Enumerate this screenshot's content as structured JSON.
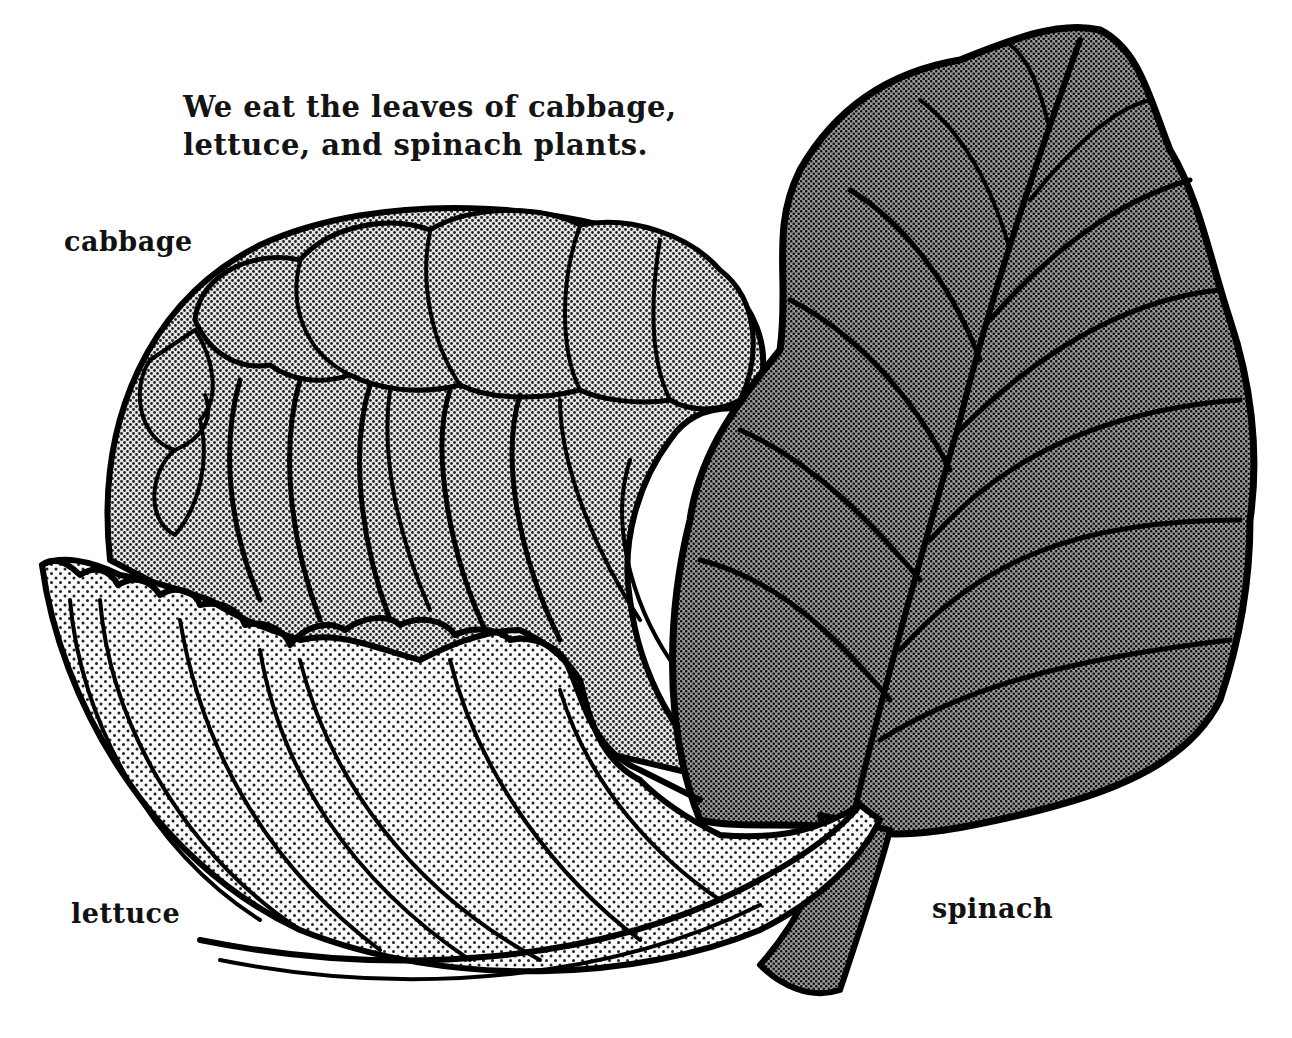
{
  "caption": {
    "line1": "We eat the leaves of cabbage,",
    "line2": "lettuce, and spinach plants."
  },
  "labels": {
    "cabbage": "cabbage",
    "lettuce": "lettuce",
    "spinach": "spinach"
  },
  "illustration": {
    "style": "black ink line art with halftone dot shading",
    "items": [
      {
        "name": "cabbage",
        "shading": "medium halftone",
        "fill_color": "#a8a8a8"
      },
      {
        "name": "lettuce",
        "shading": "light sparse dots",
        "fill_color": "#dcdcdc"
      },
      {
        "name": "spinach",
        "shading": "dark halftone",
        "fill_color": "#7a7a7a"
      }
    ],
    "ink_color": "#000000",
    "background": "#ffffff"
  }
}
